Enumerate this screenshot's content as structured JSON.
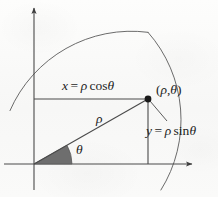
{
  "figure": {
    "name": "polar-coordinates-diagram",
    "background_color": "#fbfbfa",
    "ink_color": "#3d3d3d",
    "wedge_fill_color": "#6e6e6e",
    "point_color": "#1a1a1a"
  },
  "labels": {
    "x_component": {
      "var": "x",
      "equals": "=",
      "rho": "ρ",
      "func": "cos",
      "theta": "θ",
      "full": "x = ρ cos θ"
    },
    "y_component": {
      "var": "y",
      "equals": "=",
      "rho": "ρ",
      "func": "sin",
      "theta": "θ",
      "full": "y = ρ sin θ"
    },
    "point": {
      "open": "(",
      "rho": "ρ",
      "comma": ",",
      "theta": "θ",
      "close": ")",
      "full": "(ρ, θ)"
    },
    "radius": {
      "rho": "ρ"
    },
    "angle": {
      "theta": "θ"
    }
  },
  "geometry": {
    "origin": {
      "x": 34,
      "y": 164
    },
    "point": {
      "x": 148,
      "y": 99
    },
    "x_axis": {
      "x1": 8,
      "y1": 164,
      "x2": 197,
      "y2": 164,
      "arrow": "right"
    },
    "y_axis": {
      "x1": 34,
      "y1": 190,
      "x2": 34,
      "y2": 4,
      "arrow": "up"
    },
    "circle": {
      "cx": 34,
      "cy": 164,
      "r": 132
    },
    "wedge": {
      "radius": 38,
      "start_deg": 0,
      "end_deg": 29.7
    },
    "horizontal_projection": {
      "x1": 34,
      "y1": 99,
      "x2": 148,
      "y2": 99
    },
    "vertical_projection": {
      "x1": 148,
      "y1": 99,
      "x2": 148,
      "y2": 164
    },
    "radius_line": {
      "x1": 34,
      "y1": 164,
      "x2": 148,
      "y2": 99
    },
    "leader_line": {
      "x1": 150,
      "y1": 101,
      "x2": 166,
      "y2": 120
    }
  }
}
